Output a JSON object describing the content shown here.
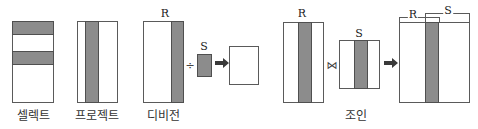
{
  "diagram": {
    "colors": {
      "fill": "#8c8c8c",
      "border": "#5a5a5a",
      "background": "#ffffff"
    },
    "operations": [
      {
        "id": "select",
        "label": "셀렉트"
      },
      {
        "id": "project",
        "label": "프로젝트"
      },
      {
        "id": "division",
        "label": "디비전",
        "left_relation": "R",
        "right_relation": "S",
        "operator": "÷"
      },
      {
        "id": "join",
        "label": "조인",
        "left_relation": "R",
        "right_relation": "S",
        "operator": "⋈",
        "result_labels": {
          "r": "R",
          "s": "S"
        }
      }
    ],
    "arrow_icon": "right-arrow"
  }
}
